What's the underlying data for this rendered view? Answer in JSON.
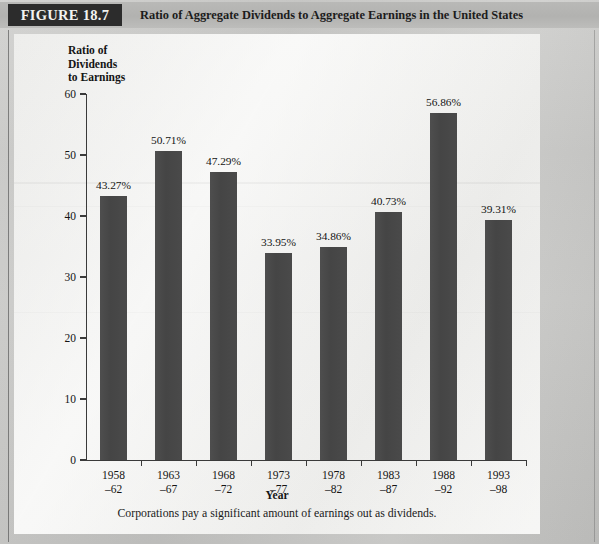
{
  "header": {
    "figure_badge": "FIGURE 18.7",
    "figure_title": "Ratio of Aggregate Dividends to Aggregate Earnings in the United States"
  },
  "caption": "Corporations pay a significant amount of earnings out as dividends.",
  "colors": {
    "bar": "#4a4a4a",
    "badge_background": "#2c2c2c",
    "badge_text": "#f2f2f0",
    "panel": "#f1f1ef",
    "page": "#c9c9c7",
    "axis": "#3a3a3a"
  },
  "chart_data": {
    "type": "bar",
    "title": "Ratio of Aggregate Dividends to Aggregate Earnings in the United States",
    "xlabel": "Year",
    "ylabel": "Ratio of Dividends to Earnings",
    "ylabel_lines": [
      "Ratio of",
      "Dividends",
      "to Earnings"
    ],
    "categories": [
      "1958\n–62",
      "1963\n–67",
      "1968\n–72",
      "1973\n–77",
      "1978\n–82",
      "1983\n–87",
      "1988\n–92",
      "1993\n–98"
    ],
    "values": [
      43.27,
      50.71,
      47.29,
      33.95,
      34.86,
      40.73,
      56.86,
      39.31
    ],
    "data_labels": [
      "43.27%",
      "50.71%",
      "47.29%",
      "33.95%",
      "34.86%",
      "40.73%",
      "56.86%",
      "39.31%"
    ],
    "ylim": [
      0,
      60
    ],
    "yticks": [
      0,
      10,
      20,
      30,
      40,
      50,
      60
    ],
    "ytick_labels": [
      "0",
      "10",
      "20",
      "30",
      "40",
      "50",
      "60"
    ],
    "grid": false,
    "legend": null
  }
}
